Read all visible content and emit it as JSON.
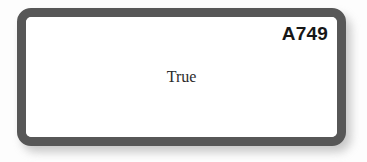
{
  "sheet": {
    "background_color": "#fdfdfd"
  },
  "card": {
    "border_color": "#575757",
    "fill_color": "#ffffff",
    "shadow_color": "#9a9a9a",
    "question_code": "A749",
    "answer_text": "True",
    "answer_text_color": "#2b2b2b",
    "question_code_color": "#171717"
  }
}
